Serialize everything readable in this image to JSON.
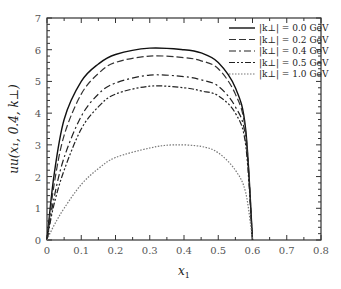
{
  "chart_data": {
    "type": "line",
    "title": "",
    "xlabel": "x_1",
    "ylabel": "uu(x_1, 0.4, k_⊥)",
    "xlim": [
      0,
      0.8
    ],
    "ylim": [
      0,
      7
    ],
    "xticks": [
      "0",
      "0.1",
      "0.2",
      "0.3",
      "0.4",
      "0.5",
      "0.6",
      "0.7",
      "0.8"
    ],
    "yticks": [
      "0",
      "1",
      "2",
      "3",
      "4",
      "5",
      "6",
      "7"
    ],
    "grid": false,
    "legend_position": "upper right",
    "series": [
      {
        "name": "|k⊥| = 0.0 GeV",
        "style": "solid",
        "x": [
          0,
          0.02,
          0.05,
          0.1,
          0.15,
          0.2,
          0.3,
          0.4,
          0.45,
          0.5,
          0.55,
          0.58,
          0.6
        ],
        "y": [
          0,
          2.0,
          3.8,
          5.0,
          5.55,
          5.85,
          6.05,
          6.0,
          5.9,
          5.6,
          4.8,
          3.5,
          0
        ]
      },
      {
        "name": "|k⊥| = 0.2 GeV",
        "style": "long-dash",
        "x": [
          0,
          0.02,
          0.05,
          0.1,
          0.15,
          0.2,
          0.3,
          0.4,
          0.45,
          0.5,
          0.55,
          0.58,
          0.6
        ],
        "y": [
          0,
          1.7,
          3.3,
          4.6,
          5.25,
          5.6,
          5.8,
          5.75,
          5.65,
          5.4,
          4.6,
          3.4,
          0
        ]
      },
      {
        "name": "|k⊥| = 0.4 GeV",
        "style": "dash-dot",
        "x": [
          0,
          0.02,
          0.05,
          0.1,
          0.15,
          0.2,
          0.3,
          0.4,
          0.45,
          0.5,
          0.55,
          0.58,
          0.6
        ],
        "y": [
          0,
          1.3,
          2.6,
          3.9,
          4.6,
          4.95,
          5.2,
          5.15,
          5.05,
          4.85,
          4.2,
          3.2,
          0
        ]
      },
      {
        "name": "|k⊥| = 0.5 GeV",
        "style": "dash-dot-dot",
        "x": [
          0,
          0.02,
          0.05,
          0.1,
          0.15,
          0.2,
          0.3,
          0.4,
          0.45,
          0.5,
          0.55,
          0.58,
          0.6
        ],
        "y": [
          0,
          1.1,
          2.2,
          3.5,
          4.2,
          4.6,
          4.85,
          4.8,
          4.7,
          4.55,
          4.0,
          3.0,
          0
        ]
      },
      {
        "name": "|k⊥| = 1.0 GeV",
        "style": "dotted",
        "x": [
          0,
          0.02,
          0.05,
          0.1,
          0.15,
          0.2,
          0.3,
          0.37,
          0.45,
          0.5,
          0.55,
          0.58,
          0.6
        ],
        "y": [
          0,
          0.45,
          1.0,
          1.75,
          2.25,
          2.6,
          2.9,
          3.0,
          2.95,
          2.75,
          2.2,
          1.5,
          0
        ]
      }
    ]
  },
  "legend": {
    "items": [
      {
        "label": "|k⊥| = 0.0 GeV"
      },
      {
        "label": "|k⊥| = 0.2 GeV"
      },
      {
        "label": "|k⊥| = 0.4 GeV"
      },
      {
        "label": "|k⊥| = 0.5 GeV"
      },
      {
        "label": "|k⊥| = 1.0 GeV"
      }
    ]
  },
  "axes": {
    "xlabel": "x₁",
    "ylabel": "uu(x₁, 0.4, k⊥)"
  }
}
